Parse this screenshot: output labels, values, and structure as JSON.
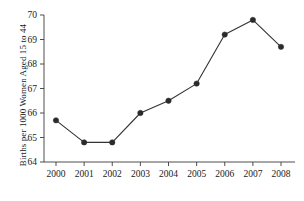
{
  "chart_data": {
    "type": "line",
    "title": "",
    "xlabel": "",
    "ylabel": "Births per 1000 Women Aged 15 to 44",
    "categories": [
      "2000",
      "2001",
      "2002",
      "2003",
      "2004",
      "2005",
      "2006",
      "2007",
      "2008"
    ],
    "values": [
      65.7,
      64.8,
      64.8,
      66.0,
      66.5,
      67.2,
      69.2,
      69.8,
      68.7
    ],
    "x": [
      2000,
      2001,
      2002,
      2003,
      2004,
      2005,
      2006,
      2007,
      2008
    ],
    "ylim": [
      64,
      70
    ],
    "yticks": [
      64,
      65,
      66,
      67,
      68,
      69,
      70
    ],
    "ytick_labels": [
      "64",
      "65",
      "66",
      "67",
      "68",
      "69",
      "70"
    ],
    "xtick_labels": [
      "2000",
      "2001",
      "2002",
      "2003",
      "2004",
      "2005",
      "2006",
      "2007",
      "2008"
    ],
    "grid": false,
    "legend": false,
    "marker": "circle",
    "line_color": "#333333",
    "marker_color": "#2b2b2b",
    "background_color": "#ffffff"
  }
}
